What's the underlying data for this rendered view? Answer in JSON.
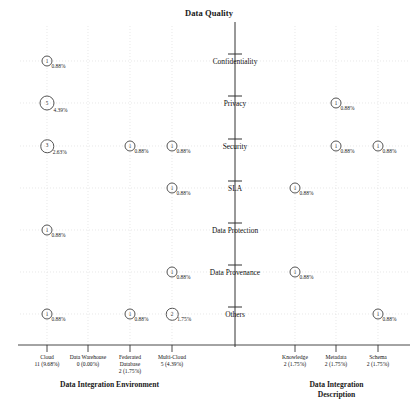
{
  "chart_data": {
    "type": "scatter",
    "title": "Data Quality",
    "xlabel": "",
    "ylabel": "Data Quality",
    "grid": true,
    "legend": "none",
    "y_categories": [
      "Confidentiality",
      "Privacy",
      "Security",
      "SLA",
      "Data Protection",
      "Data Provenance",
      "Others"
    ],
    "x_groups": [
      {
        "name": "Data Integration Environment",
        "categories": [
          {
            "name": "Cloud",
            "value": "11 (9.68%)"
          },
          {
            "name": "Data Warehouse",
            "value": "0 (0.00%)"
          },
          {
            "name": "Federated Database",
            "value": "2 (1.75%)"
          },
          {
            "name": "Multi-Cloud",
            "value": "5 (4.39%)"
          }
        ]
      },
      {
        "name": "Data Integration Description",
        "categories": [
          {
            "name": "Knowledge",
            "value": "2 (1.75%)"
          },
          {
            "name": "Metadata",
            "value": "2 (1.75%)"
          },
          {
            "name": "Schema",
            "value": "2 (1.75%)"
          }
        ]
      }
    ],
    "points": [
      {
        "x": "Cloud",
        "y": "Confidentiality",
        "count": "1",
        "pct": "0.88%"
      },
      {
        "x": "Cloud",
        "y": "Privacy",
        "count": "5",
        "pct": "4.39%"
      },
      {
        "x": "Cloud",
        "y": "Security",
        "count": "3",
        "pct": "2.63%"
      },
      {
        "x": "Federated Database",
        "y": "Security",
        "count": "1",
        "pct": "0.88%"
      },
      {
        "x": "Multi-Cloud",
        "y": "Security",
        "count": "1",
        "pct": "0.88%"
      },
      {
        "x": "Metadata",
        "y": "Privacy",
        "count": "1",
        "pct": "0.88%"
      },
      {
        "x": "Metadata",
        "y": "Security",
        "count": "1",
        "pct": "0.88%"
      },
      {
        "x": "Schema",
        "y": "Security",
        "count": "1",
        "pct": "0.88%"
      },
      {
        "x": "Multi-Cloud",
        "y": "SLA",
        "count": "1",
        "pct": "0.88%"
      },
      {
        "x": "Knowledge",
        "y": "SLA",
        "count": "1",
        "pct": "0.88%"
      },
      {
        "x": "Cloud",
        "y": "Data Protection",
        "count": "1",
        "pct": "0.88%"
      },
      {
        "x": "Multi-Cloud",
        "y": "Data Provenance",
        "count": "1",
        "pct": "0.88%"
      },
      {
        "x": "Knowledge",
        "y": "Data Provenance",
        "count": "1",
        "pct": "0.88%"
      },
      {
        "x": "Cloud",
        "y": "Others",
        "count": "1",
        "pct": "0.88%"
      },
      {
        "x": "Federated Database",
        "y": "Others",
        "count": "1",
        "pct": "0.88%"
      },
      {
        "x": "Multi-Cloud",
        "y": "Others",
        "count": "2",
        "pct": "1.75%"
      },
      {
        "x": "Schema",
        "y": "Others",
        "count": "1",
        "pct": "0.88%"
      }
    ],
    "colors": {
      "axis": "#333333",
      "grid": "#d8d8d8",
      "marker_stroke": "#555555",
      "text": "#111111"
    }
  }
}
